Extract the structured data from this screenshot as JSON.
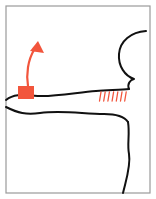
{
  "figure": {
    "canvas": {
      "width": 156,
      "height": 199,
      "background": "#ffffff"
    },
    "frame": {
      "label": "panel-border",
      "color": "#9a9a9a",
      "stroke_width": 1.2,
      "x": 6,
      "y": 6,
      "width": 144,
      "height": 187
    },
    "colors": {
      "ink": "#111111",
      "accent_red": "#f2553c",
      "frame_gray": "#9a9a9a",
      "paper": "#ffffff"
    },
    "annotations": {
      "arrow": {
        "label": "red-arrow-pointer",
        "color": "#f2553c",
        "stroke_width": 2.2,
        "tail_x": 28,
        "tail_y": 86,
        "head_x": 38,
        "head_y": 44,
        "direction": "up-right",
        "path": "M 28 86 C 26 74, 28 60, 34 50",
        "head_points": "38,41 30,51 44,53"
      },
      "marker_box": {
        "label": "red-filled-square-marker",
        "color": "#f2553c",
        "x": 18,
        "y": 86,
        "width": 16,
        "height": 13
      },
      "hatching": {
        "label": "red-hatch-ticks",
        "color": "#f2553c",
        "count": 7,
        "start_x": 101,
        "spacing": 4.2,
        "top_y": 92,
        "length": 9,
        "stroke_width": 1.3,
        "slant": 1.5
      }
    },
    "ink_strokes": [
      {
        "name": "upper-horizon-line",
        "description": "wavy horizontal ink line crossing the panel under the red marker",
        "stroke_width": 2.0,
        "path": "M 6 100 C 16 92, 28 96, 42 96 C 60 96, 80 92, 96 91 C 110 90, 122 90, 129 89"
      },
      {
        "name": "right-bulge-outline",
        "description": "rounded lobe along the right border rising from the horizon line",
        "stroke_width": 2.0,
        "path": "M 129 89 C 127 84, 130 80, 134 79 C 125 76, 118 66, 119 54 C 120 41, 131 32, 146 31"
      },
      {
        "name": "lower-horizon-line",
        "description": "second wavy ink line forming the top edge of the lower region",
        "stroke_width": 2.0,
        "path": "M 6 107 C 18 113, 26 115, 40 113 C 62 110, 84 114, 104 114 C 116 114, 124 116, 128 122"
      },
      {
        "name": "lower-region-right-edge",
        "description": "ink contour descending to the bottom border on the right",
        "stroke_width": 2.0,
        "path": "M 128 122 C 130 134, 127 144, 129 154 C 131 166, 126 180, 123 193"
      }
    ]
  }
}
